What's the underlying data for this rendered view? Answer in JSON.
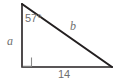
{
  "figure": {
    "kind": "right-triangle-diagram",
    "background_color": "#ffffff",
    "stroke_color": "#231f20",
    "label_color": "#6f6f6f",
    "vertices": {
      "apex": {
        "x": 22,
        "y": 4
      },
      "right_angle": {
        "x": 22,
        "y": 67
      },
      "base_right": {
        "x": 112,
        "y": 67
      }
    },
    "labels": {
      "angle": "57°",
      "leg_vertical": "a",
      "hypotenuse": "b",
      "leg_horizontal": "14"
    },
    "markers": {
      "right_angle_square": true,
      "right_angle_square_size": 9
    }
  }
}
